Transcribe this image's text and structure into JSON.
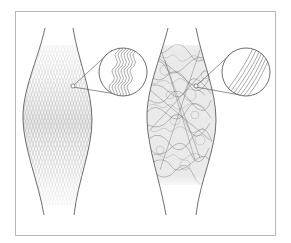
{
  "figure": {
    "left_panel": {
      "label": "",
      "fiber_pattern": "organized crimped diamond lattice",
      "inset_pattern": "parallel wavy (crimped) fibers"
    },
    "right_panel": {
      "label": "",
      "fiber_pattern": "disorganized tangled fibers",
      "inset_pattern": "parallel straight fibers"
    },
    "colors": {
      "outline": "#4a4a4a",
      "fiber_light": "#9a9a9a",
      "fiber_dark": "#3a3a3a",
      "frame": "#b8b8b8",
      "background": "#ffffff"
    }
  }
}
